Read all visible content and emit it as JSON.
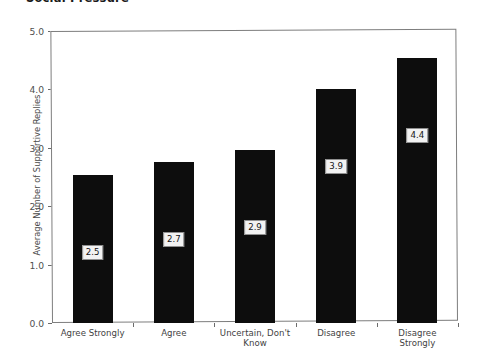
{
  "title": {
    "text": "Social Pressure",
    "clipped": true
  },
  "chart_data": {
    "type": "bar",
    "title": "Social Pressure",
    "xlabel": "",
    "ylabel": "Average Number of Supportive Replies",
    "categories": [
      "Agree Strongly",
      "Agree",
      "Uncertain, Don't\nKnow",
      "Disagree",
      "Disagree Strongly"
    ],
    "values": [
      2.5,
      2.7,
      2.9,
      3.9,
      4.4
    ],
    "bar_pixel_values": [
      2.53,
      2.75,
      2.97,
      4.0,
      4.54
    ],
    "data_labels": [
      "2.5",
      "2.7",
      "2.9",
      "3.9",
      "4.4"
    ],
    "ylim": [
      0.0,
      5.0
    ],
    "yticks": [
      "0.0",
      "1.0",
      "2.0",
      "3.0",
      "4.0",
      "5.0"
    ],
    "ytick_values": [
      0.0,
      1.0,
      2.0,
      3.0,
      4.0,
      5.0
    ],
    "grid": false,
    "legend": null,
    "bar_color": "#0d0d0d",
    "label_box_fill": "#f2f2f2",
    "label_box_border": "#8f8f8f",
    "frame_color": "#7d7d7d",
    "background": "#ffffff"
  }
}
